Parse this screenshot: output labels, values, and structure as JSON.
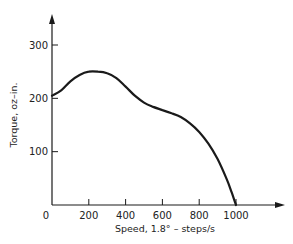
{
  "chart_data": {
    "type": "line",
    "title": "",
    "xlabel": "Speed, 1.8° – steps/s",
    "ylabel": "Torque, oz–in.",
    "xlim": [
      0,
      1000
    ],
    "ylim": [
      0,
      350
    ],
    "x_ticks": [
      0,
      200,
      400,
      600,
      800,
      1000
    ],
    "y_ticks": [
      100,
      200,
      300
    ],
    "grid": false,
    "legend": null,
    "series": [
      {
        "name": "Torque vs Speed",
        "color": "#1a1a1a",
        "x": [
          0,
          50,
          100,
          150,
          200,
          250,
          300,
          350,
          400,
          450,
          500,
          550,
          600,
          650,
          700,
          750,
          800,
          850,
          900,
          950,
          975,
          1000
        ],
        "values": [
          205,
          215,
          232,
          244,
          250,
          250,
          247,
          238,
          222,
          205,
          192,
          184,
          178,
          172,
          165,
          153,
          137,
          115,
          86,
          48,
          25,
          0
        ]
      }
    ]
  },
  "labels": {
    "x_tick_0": "0",
    "x_tick_200": "200",
    "x_tick_400": "400",
    "x_tick_600": "600",
    "x_tick_800": "800",
    "x_tick_1000": "1000",
    "y_tick_100": "100",
    "y_tick_200": "200",
    "y_tick_300": "300",
    "xlabel": "Speed, 1.8° – steps/s",
    "ylabel": "Torque, oz–in."
  }
}
